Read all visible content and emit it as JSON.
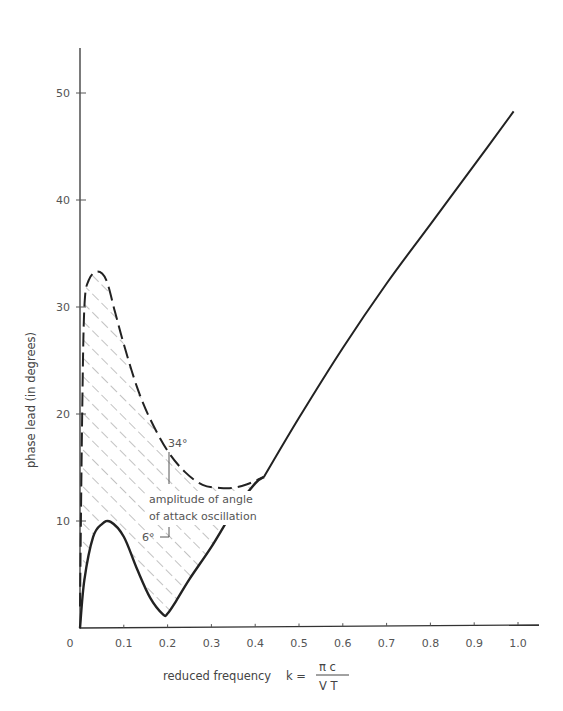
{
  "chart_data": {
    "type": "line",
    "title": "",
    "xlabel": "reduced frequency  k = πc / VT",
    "xlabel_main": "reduced frequency",
    "xlabel_k": "k =",
    "xlabel_num": "π c",
    "xlabel_den": "V T",
    "ylabel": "phase lead  (in degrees)",
    "xlim": [
      0,
      1.05
    ],
    "ylim": [
      0,
      54
    ],
    "grid": false,
    "x_ticks": [
      0,
      0.1,
      0.2,
      0.3,
      0.4,
      0.5,
      0.6,
      0.7,
      0.8,
      0.9,
      1.0
    ],
    "x_tick_labels": [
      "0",
      "0.1",
      "0.2",
      "0.3",
      "0.4",
      "0.5",
      "0.6",
      "0.7",
      "0.8",
      "0.9",
      "1.0"
    ],
    "y_ticks": [
      10,
      20,
      30,
      40,
      50
    ],
    "y_tick_labels": [
      "10",
      "20",
      "30",
      "40",
      "50"
    ],
    "series": [
      {
        "name": "amplitude 6° (lower bound)",
        "style": "solid",
        "x": [
          0.0,
          0.01,
          0.03,
          0.05,
          0.07,
          0.1,
          0.13,
          0.16,
          0.19,
          0.2,
          0.22,
          0.25,
          0.3,
          0.35,
          0.4,
          0.42
        ],
        "y": [
          0,
          4.5,
          8.5,
          9.7,
          9.9,
          8.5,
          5.5,
          2.8,
          1.2,
          1.3,
          2.5,
          4.5,
          7.5,
          10.8,
          13.4,
          14.0
        ]
      },
      {
        "name": "amplitude 34° (upper bound)",
        "style": "dashed",
        "x": [
          0.0,
          0.005,
          0.01,
          0.02,
          0.04,
          0.06,
          0.08,
          0.1,
          0.13,
          0.16,
          0.2,
          0.24,
          0.28,
          0.32,
          0.35,
          0.38,
          0.42
        ],
        "y": [
          2,
          20,
          30,
          32.5,
          33.3,
          32.5,
          29.5,
          26.5,
          22.5,
          19.5,
          16.5,
          14.5,
          13.3,
          13.0,
          13.0,
          13.3,
          14.0
        ]
      },
      {
        "name": "common curve",
        "style": "solid",
        "x": [
          0.42,
          0.5,
          0.6,
          0.7,
          0.8,
          0.9,
          0.99
        ],
        "y": [
          14.0,
          19.5,
          26.0,
          32.0,
          37.5,
          43.0,
          48.0
        ]
      }
    ],
    "annotations": [
      {
        "text": "34°",
        "x": 0.19,
        "y": 17.8
      },
      {
        "text": "amplitude of angle",
        "x": 0.12,
        "y": 12.2
      },
      {
        "text": "of attack oscillation",
        "x": 0.12,
        "y": 10.3
      },
      {
        "text": "6°",
        "x": 0.15,
        "y": 7.5
      }
    ],
    "shaded_region": "hatched area between 6° and 34° curves for k from 0 to 0.42"
  }
}
